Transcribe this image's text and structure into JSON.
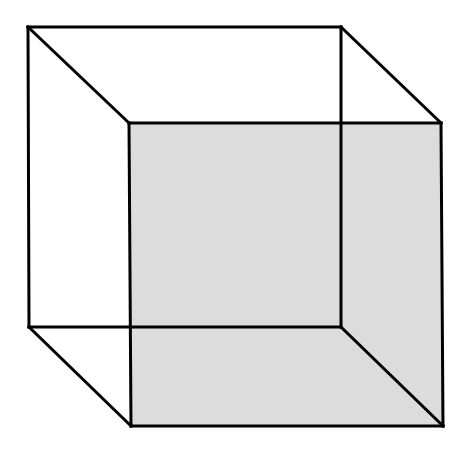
{
  "diagram": {
    "type": "necker-cube-wireframe",
    "background": "#ffffff",
    "stroke_color": "#000000",
    "stroke_width": 3,
    "front_face_fill": "#dcdcdc",
    "back_face": {
      "top_left": [
        28,
        27
      ],
      "top_right": [
        341,
        27
      ],
      "bottom_right": [
        341,
        327
      ],
      "bottom_left": [
        29,
        327
      ]
    },
    "front_face": {
      "top_left": [
        129,
        123
      ],
      "top_right": [
        441,
        123
      ],
      "bottom_right": [
        443,
        426
      ],
      "bottom_left": [
        131,
        426
      ]
    }
  }
}
